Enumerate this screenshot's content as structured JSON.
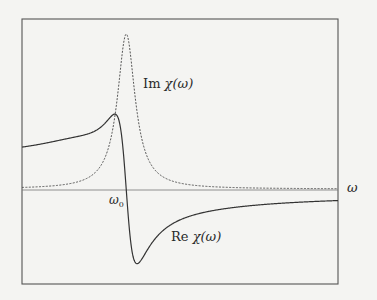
{
  "figure": {
    "labels": {
      "im": {
        "prefix": "Im ",
        "func": "χ(ω)"
      },
      "re": {
        "prefix": "Re ",
        "func": "χ(ω)"
      },
      "omega0": {
        "base": "ω",
        "sub": "0"
      },
      "x_axis": "ω"
    },
    "colors": {
      "background": "#f4f4f2",
      "frame": "#555555",
      "axis": "#666666",
      "re_curve": "#333333",
      "im_curve": "#444444"
    }
  },
  "chart_data": {
    "type": "line",
    "title": "",
    "xlabel": "ω",
    "ylabel": "",
    "grid": false,
    "legend": "inline labels",
    "annotations": [
      "Im χ(ω)",
      "Re χ(ω)",
      "ω0"
    ],
    "x_tick_labels": [
      {
        "label": "ω0",
        "x": 0.33
      }
    ],
    "xlim": [
      0,
      1
    ],
    "ylim": [
      -0.45,
      1.0
    ],
    "resonance": {
      "omega0": 0.33,
      "gamma": 0.034,
      "im_peak": 1.0,
      "re_extrema": [
        0.55,
        -0.45
      ]
    },
    "series": [
      {
        "name": "Im χ(ω)",
        "style": "dashed",
        "x": [
          0.0,
          0.1,
          0.2,
          0.25,
          0.28,
          0.3,
          0.31,
          0.32,
          0.33,
          0.34,
          0.35,
          0.36,
          0.38,
          0.41,
          0.46,
          0.55,
          0.7,
          1.0
        ],
        "values": [
          0.01,
          0.03,
          0.07,
          0.16,
          0.31,
          0.56,
          0.74,
          0.92,
          1.0,
          0.92,
          0.74,
          0.56,
          0.31,
          0.15,
          0.06,
          0.02,
          0.01,
          0.0
        ]
      },
      {
        "name": "Re χ(ω)",
        "style": "solid",
        "x": [
          0.0,
          0.1,
          0.2,
          0.25,
          0.28,
          0.3,
          0.31,
          0.33,
          0.35,
          0.36,
          0.38,
          0.41,
          0.46,
          0.55,
          0.7,
          1.0
        ],
        "values": [
          0.18,
          0.22,
          0.32,
          0.4,
          0.48,
          0.55,
          0.5,
          0.0,
          -0.4,
          -0.45,
          -0.38,
          -0.28,
          -0.18,
          -0.11,
          -0.06,
          -0.02
        ]
      }
    ]
  }
}
